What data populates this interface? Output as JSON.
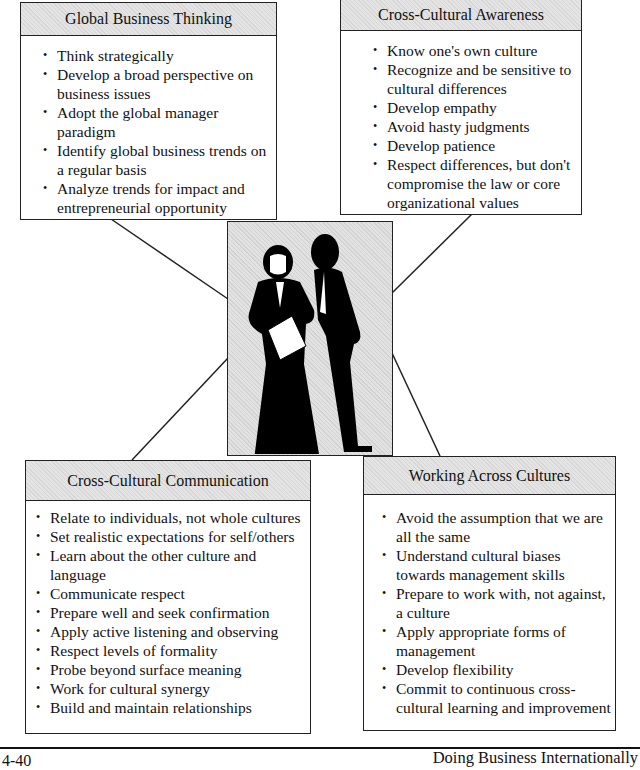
{
  "diagram": {
    "top_left": {
      "title": "Global Business Thinking",
      "items": [
        "Think strategically",
        "Develop a broad perspective on business issues",
        "Adopt the global manager paradigm",
        "Identify global business trends on a regular basis",
        "Analyze trends for impact and entrepreneurial opportunity"
      ]
    },
    "top_right": {
      "title": "Cross-Cultural Awareness",
      "items": [
        "Know one's own culture",
        "Recognize and be sensitive to cultural differences",
        "Develop empathy",
        "Avoid hasty judgments",
        "Develop patience",
        "Respect differences, but don't compromise the law or core organizational values"
      ]
    },
    "bottom_left": {
      "title": "Cross-Cultural Communication",
      "items": [
        "Relate to individuals, not whole cultures",
        "Set realistic expectations for self/others",
        "Learn about the other culture and language",
        "Communicate respect",
        "Prepare well and seek confirmation",
        "Apply active listening and observing",
        "Respect levels of formality",
        "Probe beyond surface meaning",
        "Work for cultural synergy",
        "Build and maintain relationships"
      ]
    },
    "bottom_right": {
      "title": "Working Across Cultures",
      "items": [
        "Avoid the assumption that we are all the same",
        "Understand cultural biases towards management skills",
        "Prepare to work with, not against, a culture",
        "Apply appropriate forms of management",
        "Develop flexibility",
        "Commit to continuous cross-cultural learning and improvement"
      ]
    },
    "center_image": "two-businesspeople-silhouette-icon"
  },
  "footer": {
    "page_number": "4-40",
    "book_title": "Doing Business Internationally"
  }
}
